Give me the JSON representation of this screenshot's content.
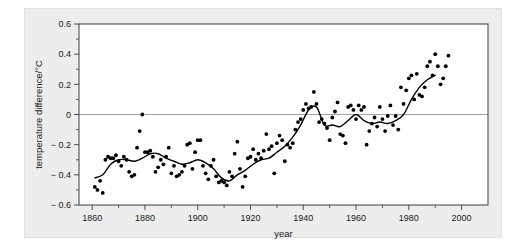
{
  "figure": {
    "background_color": "#ededed",
    "plot_background_color": "#ffffff",
    "axis_color": "#3c3c3c",
    "point_color": "#000000",
    "line_color": "#000000",
    "zero_line_color": "#8a8a8a"
  },
  "chart_data": {
    "type": "scatter",
    "title": "",
    "subtitle": "",
    "xlabel": "year",
    "ylabel": "temperature difference/°C",
    "xlim": [
      1855,
      2010
    ],
    "ylim": [
      -0.6,
      0.6
    ],
    "xticks": [
      1860,
      1880,
      1900,
      1920,
      1940,
      1960,
      1980,
      2000
    ],
    "xticklabels": [
      "1860",
      "1880",
      "1900",
      "1920",
      "1940",
      "1960",
      "1980",
      "2000"
    ],
    "xminorticks": [
      1870,
      1890,
      1910,
      1930,
      1950,
      1970,
      1990
    ],
    "yticks": [
      -0.6,
      -0.4,
      -0.2,
      0,
      0.2,
      0.4,
      0.6
    ],
    "yticklabels": [
      "− 0.6",
      "− 0.4",
      "− 0.2",
      "0",
      "0.2",
      "0.4",
      "0.6"
    ],
    "yminorticks": [
      -0.5,
      -0.3,
      -0.1,
      0.1,
      0.3,
      0.5
    ],
    "grid": false,
    "legend": false,
    "zero_reference_line": 0,
    "series": [
      {
        "name": "annual temperature difference",
        "marker": "filled-circle",
        "x": [
          1861,
          1862,
          1863,
          1864,
          1865,
          1866,
          1867,
          1868,
          1869,
          1870,
          1871,
          1872,
          1873,
          1874,
          1875,
          1876,
          1877,
          1878,
          1879,
          1880,
          1881,
          1882,
          1883,
          1884,
          1885,
          1886,
          1887,
          1888,
          1889,
          1890,
          1891,
          1892,
          1893,
          1894,
          1895,
          1896,
          1897,
          1898,
          1899,
          1900,
          1901,
          1902,
          1903,
          1904,
          1905,
          1906,
          1907,
          1908,
          1909,
          1910,
          1911,
          1912,
          1913,
          1914,
          1915,
          1916,
          1917,
          1918,
          1919,
          1920,
          1921,
          1922,
          1923,
          1924,
          1925,
          1926,
          1927,
          1928,
          1929,
          1930,
          1931,
          1932,
          1933,
          1934,
          1935,
          1936,
          1937,
          1938,
          1939,
          1940,
          1941,
          1942,
          1943,
          1944,
          1945,
          1946,
          1947,
          1948,
          1949,
          1950,
          1951,
          1952,
          1953,
          1954,
          1955,
          1956,
          1957,
          1958,
          1959,
          1960,
          1961,
          1962,
          1963,
          1964,
          1965,
          1966,
          1967,
          1968,
          1969,
          1970,
          1971,
          1972,
          1973,
          1974,
          1975,
          1976,
          1977,
          1978,
          1979,
          1980,
          1981,
          1982,
          1983,
          1984,
          1985,
          1986,
          1987,
          1988,
          1989,
          1990,
          1991,
          1992,
          1993,
          1994,
          1995
        ],
        "y": [
          -0.48,
          -0.5,
          -0.44,
          -0.52,
          -0.3,
          -0.28,
          -0.29,
          -0.29,
          -0.27,
          -0.31,
          -0.34,
          -0.28,
          -0.3,
          -0.38,
          -0.41,
          -0.4,
          -0.22,
          -0.11,
          0.0,
          -0.25,
          -0.25,
          -0.24,
          -0.28,
          -0.38,
          -0.35,
          -0.3,
          -0.33,
          -0.28,
          -0.22,
          -0.39,
          -0.34,
          -0.41,
          -0.4,
          -0.38,
          -0.34,
          -0.2,
          -0.19,
          -0.36,
          -0.25,
          -0.17,
          -0.17,
          -0.34,
          -0.39,
          -0.43,
          -0.34,
          -0.3,
          -0.41,
          -0.45,
          -0.44,
          -0.45,
          -0.47,
          -0.38,
          -0.41,
          -0.26,
          -0.18,
          -0.36,
          -0.48,
          -0.41,
          -0.29,
          -0.28,
          -0.23,
          -0.3,
          -0.26,
          -0.29,
          -0.24,
          -0.13,
          -0.23,
          -0.21,
          -0.39,
          -0.19,
          -0.14,
          -0.17,
          -0.31,
          -0.2,
          -0.22,
          -0.19,
          -0.1,
          -0.05,
          -0.03,
          0.03,
          0.07,
          0.04,
          0.05,
          0.15,
          0.07,
          -0.05,
          -0.03,
          -0.06,
          -0.09,
          -0.17,
          -0.02,
          0.02,
          0.08,
          -0.13,
          -0.14,
          -0.19,
          0.05,
          0.06,
          0.03,
          -0.03,
          0.06,
          0.03,
          0.05,
          -0.2,
          -0.11,
          -0.06,
          -0.02,
          -0.08,
          0.05,
          -0.03,
          -0.11,
          -0.01,
          0.06,
          -0.07,
          -0.01,
          -0.1,
          0.18,
          0.07,
          0.16,
          0.24,
          0.26,
          0.1,
          0.27,
          0.13,
          0.12,
          0.18,
          0.32,
          0.35,
          0.26,
          0.4,
          0.32,
          0.2,
          0.24,
          0.32,
          0.39
        ]
      }
    ],
    "smooth_curve": {
      "name": "smoothed trend",
      "x": [
        1861,
        1864,
        1867,
        1870,
        1873,
        1876,
        1879,
        1882,
        1885,
        1888,
        1891,
        1894,
        1897,
        1900,
        1903,
        1906,
        1909,
        1912,
        1915,
        1918,
        1921,
        1924,
        1927,
        1930,
        1933,
        1936,
        1939,
        1942,
        1945,
        1948,
        1951,
        1954,
        1957,
        1960,
        1963,
        1966,
        1969,
        1972,
        1975,
        1978,
        1981,
        1984,
        1987,
        1990
      ],
      "y": [
        -0.42,
        -0.4,
        -0.33,
        -0.3,
        -0.3,
        -0.31,
        -0.29,
        -0.26,
        -0.26,
        -0.29,
        -0.31,
        -0.33,
        -0.32,
        -0.3,
        -0.32,
        -0.36,
        -0.42,
        -0.44,
        -0.4,
        -0.37,
        -0.33,
        -0.3,
        -0.29,
        -0.25,
        -0.21,
        -0.15,
        -0.07,
        0.03,
        0.05,
        -0.07,
        -0.07,
        -0.08,
        -0.04,
        0.0,
        -0.04,
        -0.06,
        -0.05,
        -0.06,
        -0.04,
        0.0,
        0.1,
        0.18,
        0.23,
        0.26
      ]
    }
  }
}
